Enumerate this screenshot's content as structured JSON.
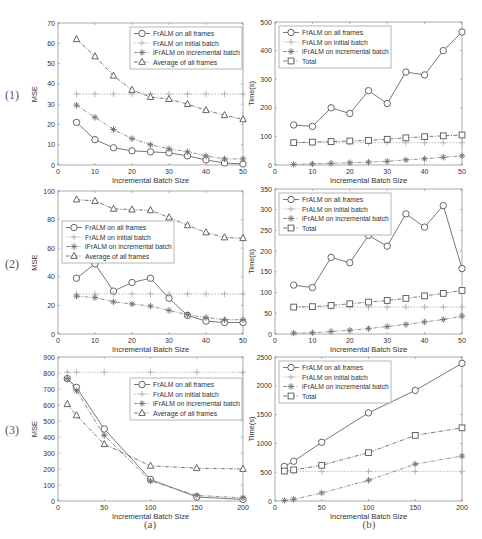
{
  "figure": {
    "row_labels": [
      "(1)",
      "(2)",
      "(3)"
    ],
    "column_labels": [
      "(a)",
      "(b)"
    ]
  },
  "chart_data": [
    {
      "id": "1a",
      "type": "line",
      "title": "",
      "xlabel": "Incremental Batch Size",
      "ylabel": "MSE",
      "xlim": [
        0,
        50
      ],
      "ylim": [
        0,
        70
      ],
      "xticks": [
        0,
        10,
        20,
        30,
        40,
        50
      ],
      "yticks": [
        0,
        10,
        20,
        30,
        40,
        50,
        60,
        70
      ],
      "legend_position": "upper right",
      "x": [
        5,
        10,
        15,
        20,
        25,
        30,
        35,
        40,
        45,
        50
      ],
      "series": [
        {
          "name": "FrALM on all frames",
          "marker": "circle",
          "dash": "solid",
          "values": [
            21,
            12.5,
            8.5,
            7,
            6.5,
            6,
            4.5,
            2.5,
            1,
            0.5
          ]
        },
        {
          "name": "FrALM on initial batch",
          "marker": "plus",
          "dash": "dotted",
          "values": [
            35,
            35,
            35,
            35,
            35,
            35,
            35,
            35,
            35,
            35
          ]
        },
        {
          "name": "iFrALM on incremental batch",
          "marker": "star",
          "dash": "dashdot",
          "values": [
            29.5,
            23.5,
            17.5,
            13,
            10,
            8,
            6.5,
            4.5,
            3,
            3
          ]
        },
        {
          "name": "Average of all frames",
          "marker": "triangle",
          "dash": "dashdot",
          "values": [
            62,
            53.5,
            44,
            37,
            33.5,
            32.5,
            30,
            27,
            24.5,
            22.5
          ]
        }
      ]
    },
    {
      "id": "1b",
      "type": "line",
      "title": "",
      "xlabel": "Incremental Batch Size",
      "ylabel": "Time(s)",
      "xlim": [
        0,
        50
      ],
      "ylim": [
        0,
        500
      ],
      "xticks": [
        0,
        10,
        20,
        30,
        40,
        50
      ],
      "yticks": [
        0,
        100,
        200,
        300,
        400,
        500
      ],
      "legend_position": "upper left",
      "x": [
        5,
        10,
        15,
        20,
        25,
        30,
        35,
        40,
        45,
        50
      ],
      "series": [
        {
          "name": "FrALM on all frames",
          "marker": "circle",
          "dash": "solid",
          "values": [
            140,
            135,
            200,
            180,
            260,
            215,
            325,
            315,
            400,
            465
          ]
        },
        {
          "name": "FrALM on initial batch",
          "marker": "plus",
          "dash": "dotted",
          "values": [
            78,
            78,
            78,
            78,
            78,
            78,
            78,
            78,
            78,
            78
          ]
        },
        {
          "name": "iFrALM on incremental batch",
          "marker": "star",
          "dash": "dashdot",
          "values": [
            2,
            4,
            6,
            8,
            10,
            13,
            18,
            22,
            27,
            32
          ]
        },
        {
          "name": "Total",
          "marker": "square",
          "dash": "dashdot",
          "values": [
            78,
            80,
            82,
            84,
            86,
            90,
            95,
            99,
            102,
            105
          ]
        }
      ]
    },
    {
      "id": "2a",
      "type": "line",
      "title": "",
      "xlabel": "Incremental Batch Size",
      "ylabel": "MSE",
      "xlim": [
        0,
        50
      ],
      "ylim": [
        0,
        100
      ],
      "xticks": [
        0,
        10,
        20,
        30,
        40,
        50
      ],
      "yticks": [
        0,
        20,
        40,
        60,
        80,
        100
      ],
      "legend_position": "center left",
      "x": [
        5,
        10,
        15,
        20,
        25,
        30,
        35,
        40,
        45,
        50
      ],
      "series": [
        {
          "name": "FrALM on all frames",
          "marker": "circle",
          "dash": "solid",
          "values": [
            39,
            49,
            30,
            36,
            39,
            25,
            13,
            9,
            8,
            8
          ]
        },
        {
          "name": "FrALM on initial batch",
          "marker": "plus",
          "dash": "dotted",
          "values": [
            28,
            28,
            28,
            28,
            28,
            28,
            28,
            28,
            28,
            28
          ]
        },
        {
          "name": "iFrALM on incremental batch",
          "marker": "star",
          "dash": "dashdot",
          "values": [
            26.5,
            25.5,
            22.5,
            21,
            19.5,
            16.5,
            13.5,
            11.5,
            10,
            10
          ]
        },
        {
          "name": "Average of all frames",
          "marker": "triangle",
          "dash": "dashdot",
          "values": [
            94,
            93,
            87.5,
            87,
            86.5,
            81.5,
            76,
            71,
            67.5,
            67
          ]
        }
      ]
    },
    {
      "id": "2b",
      "type": "line",
      "title": "",
      "xlabel": "Incremental Batch Size",
      "ylabel": "Time(s)",
      "xlim": [
        0,
        50
      ],
      "ylim": [
        0,
        350
      ],
      "xticks": [
        0,
        10,
        20,
        30,
        40,
        50
      ],
      "yticks": [
        0,
        50,
        100,
        150,
        200,
        250,
        300,
        350
      ],
      "legend_position": "upper left",
      "x": [
        5,
        10,
        15,
        20,
        25,
        30,
        35,
        40,
        45,
        50
      ],
      "series": [
        {
          "name": "FrALM on all frames",
          "marker": "circle",
          "dash": "solid",
          "values": [
            118,
            112,
            185,
            172,
            238,
            212,
            290,
            258,
            310,
            158
          ]
        },
        {
          "name": "FrALM on initial batch",
          "marker": "plus",
          "dash": "dotted",
          "values": [
            65,
            65,
            65,
            65,
            65,
            65,
            65,
            65,
            65,
            65
          ]
        },
        {
          "name": "iFrALM on incremental batch",
          "marker": "star",
          "dash": "dashdot",
          "values": [
            2,
            3,
            6,
            9,
            13,
            18,
            23,
            29,
            35,
            43
          ]
        },
        {
          "name": "Total",
          "marker": "square",
          "dash": "dashdot",
          "values": [
            65,
            66,
            69,
            73,
            77,
            81,
            86,
            92,
            98,
            105
          ]
        }
      ]
    },
    {
      "id": "3a",
      "type": "line",
      "title": "",
      "xlabel": "Incremental Batch Size",
      "ylabel": "MSE",
      "xlim": [
        0,
        200
      ],
      "ylim": [
        0,
        900
      ],
      "xticks": [
        0,
        50,
        100,
        150,
        200
      ],
      "yticks": [
        0,
        100,
        200,
        300,
        400,
        500,
        600,
        700,
        800,
        900
      ],
      "legend_position": "upper right",
      "x": [
        10,
        20,
        50,
        100,
        150,
        200
      ],
      "series": [
        {
          "name": "FrALM on all frames",
          "marker": "circle",
          "dash": "solid",
          "values": [
            765,
            710,
            450,
            135,
            25,
            10
          ]
        },
        {
          "name": "FrALM on initial batch",
          "marker": "plus",
          "dash": "dotted",
          "values": [
            805,
            805,
            805,
            805,
            805,
            805
          ]
        },
        {
          "name": "iFrALM on incremental batch",
          "marker": "star",
          "dash": "dashdot",
          "values": [
            765,
            690,
            410,
            125,
            35,
            20
          ]
        },
        {
          "name": "Average of all frames",
          "marker": "triangle",
          "dash": "dashdot",
          "values": [
            605,
            535,
            355,
            220,
            205,
            200
          ]
        }
      ]
    },
    {
      "id": "3b",
      "type": "line",
      "title": "",
      "xlabel": "Incremental Batch Size",
      "ylabel": "Time(s)",
      "xlim": [
        0,
        200
      ],
      "ylim": [
        0,
        2500
      ],
      "xticks": [
        0,
        50,
        100,
        150,
        200
      ],
      "yticks": [
        0,
        500,
        1000,
        1500,
        2000,
        2500
      ],
      "legend_position": "upper left",
      "x": [
        10,
        20,
        50,
        100,
        150,
        200
      ],
      "series": [
        {
          "name": "FrALM on all frames",
          "marker": "circle",
          "dash": "solid",
          "values": [
            600,
            690,
            1020,
            1530,
            1920,
            2390
          ]
        },
        {
          "name": "FrALM on initial batch",
          "marker": "plus",
          "dash": "dotted",
          "values": [
            515,
            515,
            515,
            515,
            515,
            515
          ]
        },
        {
          "name": "iFrALM on incremental batch",
          "marker": "star",
          "dash": "dashdot",
          "values": [
            10,
            30,
            140,
            360,
            640,
            780
          ]
        },
        {
          "name": "Total",
          "marker": "square",
          "dash": "dashdot",
          "values": [
            520,
            540,
            620,
            840,
            1140,
            1270
          ]
        }
      ]
    }
  ]
}
